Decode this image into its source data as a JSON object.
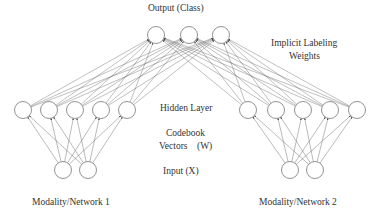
{
  "labels": {
    "output": "Output (Class)",
    "implicit_line1": "Implicit Labeling",
    "implicit_line2": "Weights",
    "hidden": "Hidden Layer",
    "codebook_line1": "Codebook",
    "codebook_line2": "Vectors    (W)",
    "input": "Input (X)",
    "modality1": "Modality/Network 1",
    "modality2": "Modality/Network 2"
  },
  "nodes": {
    "radius": 8.5,
    "output": [
      [
        156,
        35
      ],
      [
        189,
        35
      ],
      [
        221,
        35
      ]
    ],
    "hidden_left": [
      [
        23,
        110
      ],
      [
        49,
        110
      ],
      [
        75,
        110
      ],
      [
        101,
        110
      ],
      [
        127,
        110
      ]
    ],
    "hidden_right": [
      [
        248,
        110
      ],
      [
        276,
        110
      ],
      [
        303,
        110
      ],
      [
        330,
        110
      ],
      [
        357,
        110
      ]
    ],
    "input_left": [
      [
        63,
        170
      ],
      [
        88,
        170
      ]
    ],
    "input_right": [
      [
        290,
        170
      ],
      [
        315,
        170
      ]
    ]
  },
  "colors": {
    "node_stroke": "#777777",
    "edge": "#555555",
    "text": "#333333"
  }
}
